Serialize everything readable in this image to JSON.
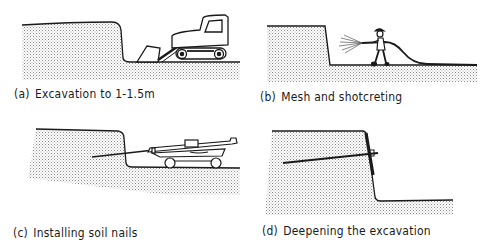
{
  "figure": {
    "panels": [
      {
        "id": "a",
        "tag": "(a)",
        "caption": "Excavation to 1-1.5m",
        "depicts": "excavator-loader digging at base of ground cut"
      },
      {
        "id": "b",
        "tag": "(b)",
        "caption": "Mesh and shotcreting",
        "depicts": "worker spraying shotcrete onto cut face with hose"
      },
      {
        "id": "c",
        "tag": "(c)",
        "caption": "Installing soil nails",
        "depicts": "drilling rig on tracks inserting inclined soil nail"
      },
      {
        "id": "d",
        "tag": "(d)",
        "caption": "Deepening the excavation",
        "depicts": "installed nail with facing; excavation lowered"
      }
    ],
    "colors": {
      "ink": "#1a1a1a",
      "soil_stipple": "#9a9a9a",
      "background": "#ffffff"
    }
  }
}
